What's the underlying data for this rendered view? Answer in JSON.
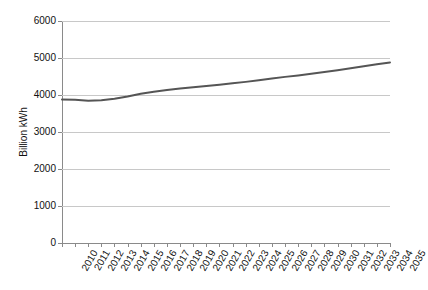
{
  "chart_data": {
    "type": "line",
    "title": "",
    "subtitle": "",
    "xlabel": "",
    "ylabel": "Billion kWh",
    "ylim": [
      0,
      6000
    ],
    "yticks": [
      0,
      1000,
      2000,
      3000,
      4000,
      5000,
      6000
    ],
    "ytick_labels": [
      "0",
      "1000",
      "2000",
      "3000",
      "4000",
      "5000",
      "6000"
    ],
    "grid": "horizontal",
    "legend": "none",
    "legend_position": "none",
    "line_color": "#555555",
    "grid_color": "#c8c8c8",
    "axis_color": "#8a8a8a",
    "categories": [
      "2010",
      "2011",
      "2012",
      "2013",
      "2014",
      "2015",
      "2016",
      "2017",
      "2018",
      "2019",
      "2020",
      "2021",
      "2022",
      "2023",
      "2024",
      "2025",
      "2026",
      "2027",
      "2028",
      "2029",
      "2030",
      "2031",
      "2032",
      "2033",
      "2034",
      "2035"
    ],
    "series": [
      {
        "name": "Electricity consumption",
        "values": [
          3880,
          3870,
          3845,
          3860,
          3900,
          3960,
          4035,
          4090,
          4135,
          4175,
          4210,
          4245,
          4280,
          4315,
          4355,
          4400,
          4445,
          4490,
          4530,
          4575,
          4620,
          4670,
          4720,
          4775,
          4830,
          4880
        ]
      }
    ]
  }
}
